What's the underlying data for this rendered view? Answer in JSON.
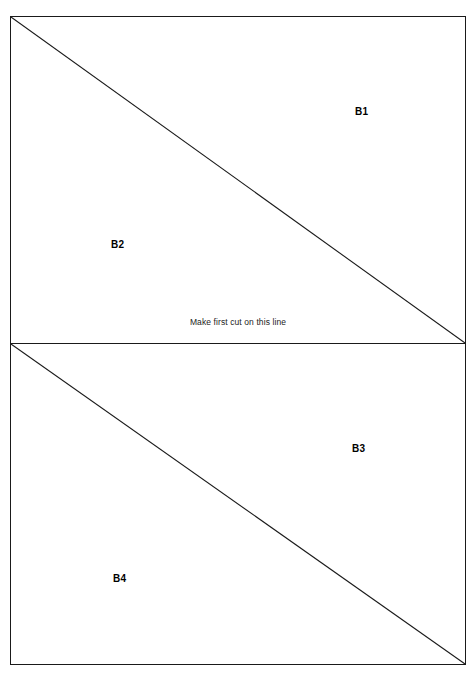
{
  "diagram": {
    "type": "cutting-template",
    "background_color": "#ffffff",
    "line_color": "#1a1a1a",
    "text_color": "#000000",
    "instruction": {
      "text": "Make first cut on this line"
    },
    "panels": [
      {
        "id": "top",
        "regions": [
          {
            "id": "b1",
            "label": "B1",
            "position": "upper-right"
          },
          {
            "id": "b2",
            "label": "B2",
            "position": "lower-left"
          }
        ],
        "diagonal": "top-left-to-bottom-right"
      },
      {
        "id": "bottom",
        "regions": [
          {
            "id": "b3",
            "label": "B3",
            "position": "upper-right"
          },
          {
            "id": "b4",
            "label": "B4",
            "position": "lower-left"
          }
        ],
        "diagonal": "top-left-to-bottom-right"
      }
    ]
  }
}
